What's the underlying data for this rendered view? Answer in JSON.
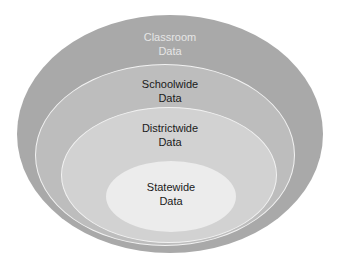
{
  "diagram": {
    "title": "",
    "type": "nested-ellipses",
    "layers": [
      {
        "line1": "Classroom",
        "line2": "Data",
        "fill": "#a9a9a9",
        "text_color": "#e6e6e6"
      },
      {
        "line1": "Schoolwide",
        "line2": "Data",
        "fill": "#bdbdbd",
        "text_color": "#1a1a1a"
      },
      {
        "line1": "Districtwide",
        "line2": "Data",
        "fill": "#d2d2d2",
        "text_color": "#1a1a1a"
      },
      {
        "line1": "Statewide",
        "line2": "Data",
        "fill": "#ececec",
        "text_color": "#1a1a1a"
      }
    ]
  }
}
